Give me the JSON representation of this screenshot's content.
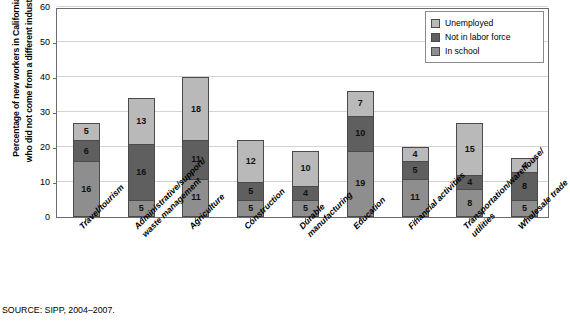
{
  "chart_data": {
    "type": "bar",
    "subtype": "stacked-bar",
    "title": "",
    "xlabel": "",
    "ylabel": "Percentage of new workers in California who did not come from a different industry",
    "ylim": [
      0,
      60
    ],
    "yticks": [
      0,
      10,
      20,
      30,
      40,
      50,
      60
    ],
    "grid": true,
    "legend_position": "top-right",
    "categories": [
      "Travel/tourism",
      "Administrative/support/ waste management",
      "Agriculture",
      "Construction",
      "Durable manufacturing",
      "Education",
      "Financial activities",
      "Transportation/warehouse/ utilities",
      "Wholesale trade"
    ],
    "series": [
      {
        "name": "In school",
        "color": "#8e8e8e",
        "values": [
          16,
          5,
          11,
          5,
          5,
          19,
          11,
          8,
          5
        ]
      },
      {
        "name": "Not in labor force",
        "color": "#5f5f5f",
        "values": [
          6,
          16,
          11,
          5,
          4,
          10,
          5,
          4,
          8
        ]
      },
      {
        "name": "Unemployed",
        "color": "#b9b9b9",
        "values": [
          5,
          13,
          18,
          12,
          10,
          7,
          4,
          15,
          4
        ]
      }
    ],
    "totals": [
      27,
      34,
      40,
      22,
      19,
      36,
      20,
      27,
      17
    ]
  },
  "yaxis": {
    "ticks": [
      "60",
      "50",
      "40",
      "30",
      "20",
      "10",
      "0"
    ],
    "title_line1": "Percentage of new workers in California",
    "title_line2": "who did not come from a different industry"
  },
  "xaxis": {
    "labels": [
      {
        "lines": [
          "Travel/tourism"
        ]
      },
      {
        "lines": [
          "Administrative/support/",
          "waste management"
        ]
      },
      {
        "lines": [
          "Agriculture"
        ]
      },
      {
        "lines": [
          "Construction"
        ]
      },
      {
        "lines": [
          "Durable",
          "manufacturing"
        ]
      },
      {
        "lines": [
          "Education"
        ]
      },
      {
        "lines": [
          "Financial activities"
        ]
      },
      {
        "lines": [
          "Transportation/warehouse/",
          "utilities"
        ]
      },
      {
        "lines": [
          "Wholesale trade"
        ]
      }
    ]
  },
  "legend": {
    "items": [
      {
        "label": "Unemployed",
        "color": "#b9b9b9"
      },
      {
        "label": "Not in labor force",
        "color": "#5f5f5f"
      },
      {
        "label": "In school",
        "color": "#8e8e8e"
      }
    ]
  },
  "source": {
    "text": "SOURCE: SIPP, 2004–2007."
  }
}
